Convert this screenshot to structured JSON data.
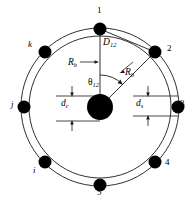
{
  "figure": {
    "colors": {
      "node_fill": "#000000",
      "line": "#1a1a1a",
      "background": "#ffffff"
    },
    "geometry": {
      "canvas_width": 190,
      "canvas_height": 200,
      "center_x": 100,
      "center_y": 107,
      "hub_radius": 13,
      "inner_circle_radius": 71,
      "outer_circle_radius": 79,
      "node_radius": 6.5
    }
  },
  "hub": {
    "name": "central-hub",
    "cx": 100,
    "cy": 107,
    "r": 13
  },
  "nodes": [
    {
      "id": "1",
      "label": "1",
      "kind": "numbered",
      "angle_deg": 90,
      "cx": 100,
      "cy": 29,
      "label_x": 97,
      "label_y": 6
    },
    {
      "id": "2",
      "label": "2",
      "kind": "numbered",
      "angle_deg": 45,
      "cx": 155,
      "cy": 52,
      "label_x": 167,
      "label_y": 44
    },
    {
      "id": "3",
      "label": "3",
      "kind": "numbered",
      "angle_deg": 0,
      "cx": 178,
      "cy": 107,
      "label_x": 180,
      "label_y": 99
    },
    {
      "id": "4",
      "label": "4",
      "kind": "numbered",
      "angle_deg": -45,
      "cx": 155,
      "cy": 162,
      "label_x": 165,
      "label_y": 158
    },
    {
      "id": "5",
      "label": "5",
      "kind": "numbered",
      "angle_deg": -90,
      "cx": 100,
      "cy": 185,
      "label_x": 97,
      "label_y": 188
    },
    {
      "id": "i",
      "label": "i",
      "kind": "peer",
      "angle_deg": -135,
      "cx": 45,
      "cy": 162,
      "label_x": 33,
      "label_y": 166
    },
    {
      "id": "j",
      "label": "j",
      "kind": "peer",
      "angle_deg": 180,
      "cx": 24,
      "cy": 107,
      "label_x": 11,
      "label_y": 100
    },
    {
      "id": "k",
      "label": "k",
      "kind": "peer",
      "angle_deg": 135,
      "cx": 45,
      "cy": 52,
      "label_x": 28,
      "label_y": 40
    }
  ],
  "annotations": {
    "distance_12": {
      "name": "distance-label-D12",
      "text": "D",
      "subscript": "12",
      "x": 103,
      "y": 38
    },
    "radius_hub_to_node1": {
      "name": "radius-label-Rb-left",
      "text": "R",
      "subscript": "b",
      "x": 68,
      "y": 58
    },
    "radius_hub_to_node2": {
      "name": "radius-label-Rb-right",
      "text": "R",
      "subscript": "b",
      "x": 125,
      "y": 68
    },
    "angle_12": {
      "name": "angle-label-theta12",
      "text": "θ",
      "subscript": "12",
      "x": 88,
      "y": 78
    },
    "spacing_c": {
      "name": "spacing-label-dc",
      "text": "d",
      "subscript": "c",
      "x": 61,
      "y": 99
    },
    "spacing_s": {
      "name": "spacing-label-ds",
      "text": "d",
      "subscript": "s",
      "x": 136,
      "y": 99
    }
  },
  "arcs": {
    "inner_circle_name": "inner-circle",
    "outer_circle_name": "outer-circle",
    "chord_1_to_2_name": "chord-node1-node2",
    "angle_arc_name": "angle-arc-theta12"
  }
}
